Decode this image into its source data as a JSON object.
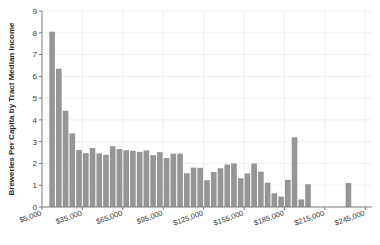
{
  "chart_data": {
    "type": "bar",
    "title": "",
    "xlabel": "",
    "ylabel": "Breweries Per Capita by Tract Median Income",
    "xlim": [
      5000,
      250000
    ],
    "ylim": [
      0,
      9
    ],
    "grid": true,
    "legend": null,
    "bar_width_dollars": 5000,
    "xtick_labels": [
      "$5,000",
      "$35,000",
      "$65,000",
      "$95,000",
      "$125,000",
      "$155,000",
      "$185,000",
      "$215,000",
      "$245,000"
    ],
    "xtick_values": [
      5000,
      35000,
      65000,
      95000,
      125000,
      155000,
      185000,
      215000,
      245000
    ],
    "ytick_labels": [
      "0",
      "1",
      "2",
      "3",
      "4",
      "5",
      "6",
      "7",
      "8",
      "9"
    ],
    "ytick_values": [
      0,
      1,
      2,
      3,
      4,
      5,
      6,
      7,
      8,
      9
    ],
    "x": [
      12500,
      17500,
      22500,
      27500,
      32500,
      37500,
      42500,
      47500,
      52500,
      57500,
      62500,
      67500,
      72500,
      77500,
      82500,
      87500,
      92500,
      97500,
      102500,
      107500,
      112500,
      117500,
      122500,
      127500,
      132500,
      137500,
      142500,
      147500,
      152500,
      157500,
      162500,
      167500,
      172500,
      177500,
      182500,
      187500,
      192500,
      197500,
      202500,
      232500
    ],
    "values": [
      8.05,
      6.35,
      4.42,
      3.38,
      2.62,
      2.47,
      2.71,
      2.46,
      2.4,
      2.79,
      2.66,
      2.61,
      2.58,
      2.53,
      2.6,
      2.38,
      2.52,
      2.25,
      2.45,
      2.45,
      1.55,
      1.81,
      1.8,
      1.23,
      1.61,
      1.78,
      1.95,
      2.0,
      1.32,
      1.54,
      2.0,
      1.62,
      1.12,
      0.63,
      0.48,
      1.25,
      3.2,
      0.35,
      1.05,
      1.1
    ],
    "series_name": "Breweries Per Capita",
    "bar_color": "#969696",
    "grid_color": "#e8e8e8",
    "axis_color": "#7a7a7a"
  }
}
